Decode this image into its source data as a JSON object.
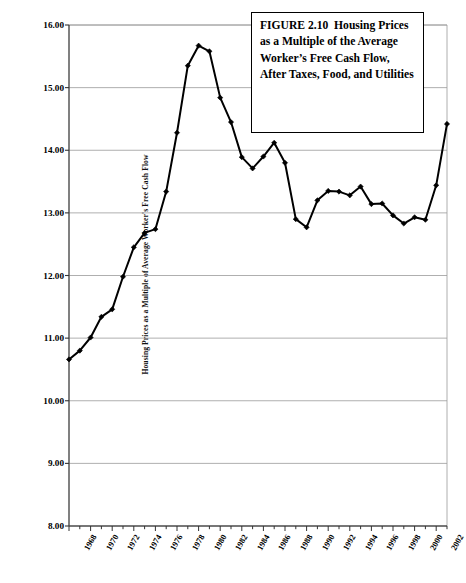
{
  "caption": {
    "text": "FIGURE 2.10  Housing Prices as a Multiple of the Average Worker’s Free Cash Flow, After Taxes, Food, and Utilities"
  },
  "axes": {
    "y_title": "Housing Prices as a Multiple of Average Worker's Free Cash Flow",
    "y_ticks": [
      "16.00",
      "15.00",
      "14.00",
      "13.00",
      "12.00",
      "11.00",
      "10.00",
      "9.00",
      "8.00"
    ],
    "x_ticks": [
      "1968",
      "1970",
      "1972",
      "1974",
      "1976",
      "1978",
      "1980",
      "1982",
      "1984",
      "1986",
      "1988",
      "1990",
      "1992",
      "1994",
      "1996",
      "1998",
      "2000",
      "2002"
    ]
  },
  "chart_data": {
    "type": "line",
    "title": "FIGURE 2.10  Housing Prices as a Multiple of the Average Worker’s Free Cash Flow, After Taxes, Food, and Utilities",
    "xlabel": "",
    "ylabel": "Housing Prices as a Multiple of Average Worker's Free Cash Flow",
    "ylim": [
      8.0,
      16.0
    ],
    "xlim": [
      1968,
      2003
    ],
    "ytick_step": 1.0,
    "grid": true,
    "grid_axis": "y",
    "legend": "none",
    "marker": "diamond",
    "line_color": "#000000",
    "x": [
      1968,
      1969,
      1970,
      1971,
      1972,
      1973,
      1974,
      1975,
      1976,
      1977,
      1978,
      1979,
      1980,
      1981,
      1982,
      1983,
      1984,
      1985,
      1986,
      1987,
      1988,
      1989,
      1990,
      1991,
      1992,
      1993,
      1994,
      1995,
      1996,
      1997,
      1998,
      1999,
      2000,
      2001,
      2002,
      2003
    ],
    "values": [
      10.66,
      10.8,
      11.01,
      11.34,
      11.46,
      11.98,
      12.45,
      12.68,
      12.74,
      13.34,
      14.28,
      15.35,
      15.67,
      15.58,
      14.84,
      14.45,
      13.89,
      13.71,
      13.9,
      14.12,
      13.8,
      12.9,
      12.77,
      13.2,
      13.35,
      13.34,
      13.28,
      13.42,
      13.14,
      13.15,
      12.96,
      12.83,
      12.93,
      12.89,
      13.44,
      14.42
    ],
    "series": [
      {
        "name": "Housing Prices as a Multiple of Average Worker's Free Cash Flow",
        "values": [
          10.66,
          10.8,
          11.01,
          11.34,
          11.46,
          11.98,
          12.45,
          12.68,
          12.74,
          13.34,
          14.28,
          15.35,
          15.67,
          15.58,
          14.84,
          14.45,
          13.89,
          13.71,
          13.9,
          14.12,
          13.8,
          12.9,
          12.77,
          13.2,
          13.35,
          13.34,
          13.28,
          13.42,
          13.14,
          13.15,
          12.96,
          12.83,
          12.93,
          12.89,
          13.44,
          14.42
        ]
      }
    ]
  }
}
